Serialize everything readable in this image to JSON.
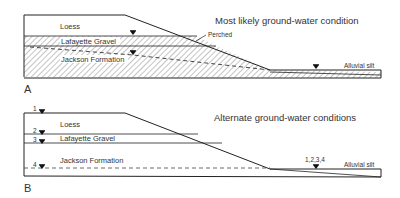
{
  "panels": [
    {
      "id": "A",
      "letter": "A",
      "title": "Most likely ground-water condition",
      "layers": {
        "loess": "Loess",
        "gravel": "Lafayette Gravel",
        "jackson": "Jackson Formation",
        "alluvial": "Alluvial silt"
      },
      "annotations": {
        "perched": "Perched"
      }
    },
    {
      "id": "B",
      "letter": "B",
      "title": "Alternate ground-water conditions",
      "layers": {
        "loess": "Loess",
        "gravel": "Lafayette Gravel",
        "jackson": "Jackson Formation",
        "alluvial": "Alluvial silt"
      },
      "markers": [
        "1",
        "2",
        "3",
        "4"
      ],
      "annotations": {
        "combined": "1,2,3,4"
      }
    }
  ],
  "colors": {
    "line": "#222222",
    "hatch": "#888888",
    "text": "#333333"
  }
}
